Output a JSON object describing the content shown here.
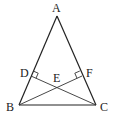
{
  "diagram": {
    "type": "geometry",
    "points": {
      "A": {
        "label": "A",
        "x": 57,
        "y": 16,
        "label_x": 52,
        "label_y": 12
      },
      "B": {
        "label": "B",
        "x": 19,
        "y": 105,
        "label_x": 6,
        "label_y": 111
      },
      "C": {
        "label": "C",
        "x": 96,
        "y": 105,
        "label_x": 100,
        "label_y": 111
      },
      "D": {
        "label": "D",
        "x": 31,
        "y": 76,
        "label_x": 20,
        "label_y": 76
      },
      "E": {
        "label": "E",
        "x": 57,
        "y": 86,
        "label_x": 53,
        "label_y": 82
      },
      "F": {
        "label": "F",
        "x": 82,
        "y": 76,
        "label_x": 86,
        "label_y": 76
      }
    },
    "segments": [
      "AB",
      "AC",
      "BC",
      "CD",
      "BF"
    ],
    "right_angles": [
      "D",
      "F"
    ],
    "stroke_color": "#222222"
  }
}
